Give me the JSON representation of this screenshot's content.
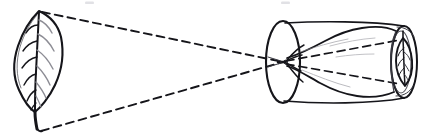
{
  "figure": {
    "title": "Pinhole camera ray diagram",
    "background_color": "#ffffff",
    "ink_color": "#15151a",
    "soft_ink_color": "#8d8d95",
    "mid_ink_color": "#3a3a42"
  },
  "objects": {
    "leaf": {
      "name": "leaf-object",
      "label": "",
      "tip_point": {
        "x": 39,
        "y": 11
      },
      "base_point": {
        "x": 38,
        "y": 130
      },
      "blade_top": {
        "x": 39,
        "y": 11
      },
      "blade_bottom": {
        "x": 35,
        "y": 112
      },
      "width_px": 46,
      "height_px": 120,
      "vein_count": 7,
      "orientation": "upright"
    },
    "pinhole": {
      "name": "pinhole-aperture",
      "label": "",
      "x": 283,
      "y": 62,
      "radius_px": 2
    },
    "cylinder": {
      "name": "camera-obscura-cylinder",
      "label": "",
      "near_face_center": {
        "x": 283,
        "y": 62
      },
      "far_face_center": {
        "x": 404,
        "y": 62
      },
      "near_face_rx": 17,
      "near_face_ry": 41,
      "far_face_rx": 13,
      "far_face_ry": 36,
      "top_edge_y": 22,
      "bottom_edge_y": 102,
      "length_px": 121
    },
    "projected_image": {
      "name": "projected-inverted-leaf-image",
      "label": "",
      "center": {
        "x": 404,
        "y": 62
      },
      "width_px": 16,
      "height_px": 48,
      "orientation": "inverted"
    }
  },
  "rays": {
    "name": "light-ray-bundle",
    "style": "dashed",
    "dash_length_px": 8,
    "dash_gap_px": 5,
    "upper_ray": {
      "label": "",
      "from": {
        "x": 42,
        "y": 12
      },
      "to": {
        "x": 283,
        "y": 62
      }
    },
    "lower_ray": {
      "label": "",
      "from": {
        "x": 41,
        "y": 131
      },
      "to": {
        "x": 283,
        "y": 62
      }
    },
    "inner_upper_ray": {
      "label": "",
      "from": {
        "x": 286,
        "y": 61
      },
      "to": {
        "x": 400,
        "y": 40
      }
    },
    "inner_lower_ray": {
      "label": "",
      "from": {
        "x": 286,
        "y": 64
      },
      "to": {
        "x": 400,
        "y": 84
      }
    }
  },
  "artifacts": [
    {
      "name": "scan-speck-left",
      "x": 85,
      "y": 2,
      "w": 9,
      "h": 3
    },
    {
      "name": "scan-speck-right",
      "x": 281,
      "y": 2,
      "w": 9,
      "h": 3
    }
  ]
}
